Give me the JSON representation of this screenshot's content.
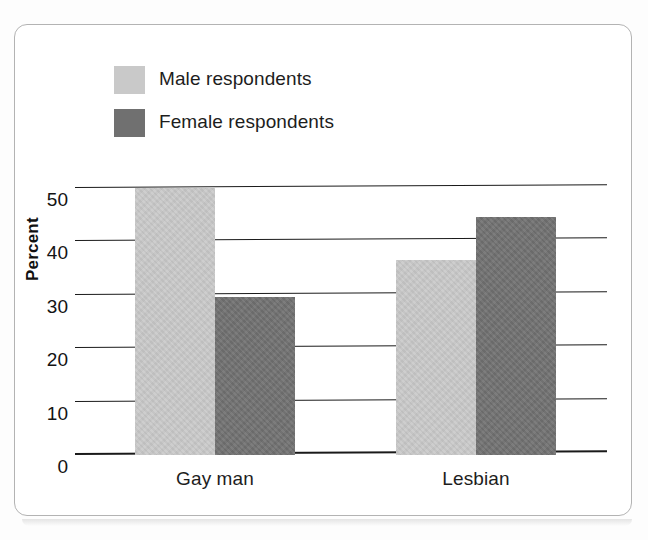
{
  "chart_data": {
    "type": "bar",
    "title": "",
    "xlabel": "",
    "ylabel": "Percent",
    "categories": [
      "Gay man",
      "Lesbian"
    ],
    "series": [
      {
        "name": "Male respondents",
        "color": "#c9c9c9",
        "values": [
          50,
          36.5
        ]
      },
      {
        "name": "Female respondents",
        "color": "#707070",
        "values": [
          29.5,
          44.5
        ]
      }
    ],
    "ylim": [
      0,
      55
    ],
    "yticks": [
      0,
      10,
      20,
      30,
      40,
      50
    ],
    "ytick_labels": [
      "0",
      "10",
      "20",
      "30",
      "40",
      "50"
    ],
    "grid": true,
    "grid_axis": "y",
    "legend_position": "top-left"
  },
  "legend": {
    "items": [
      {
        "label": "Male respondents",
        "swatch": "#c9c9c9"
      },
      {
        "label": "Female respondents",
        "swatch": "#707070"
      }
    ]
  },
  "axes": {
    "y_title": "Percent",
    "y_tick_labels": [
      "50",
      "40",
      "30",
      "20",
      "10",
      "0"
    ],
    "x_tick_labels": [
      "Gay man",
      "Lesbian"
    ]
  },
  "style": {
    "background": "#ffffff",
    "frame_border": "#b3b3b3",
    "gridline_color": "#1a1a1a",
    "text_color": "#1d1d1d",
    "light_bar": "#c9c9c9",
    "dark_bar": "#707070"
  }
}
